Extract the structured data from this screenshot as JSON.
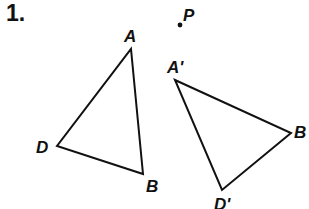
{
  "problem": {
    "number": "1."
  },
  "point": {
    "label": "P",
    "x": 180,
    "y": 25
  },
  "triangles": [
    {
      "name": "original",
      "vertices": [
        {
          "label": "A",
          "x": 131,
          "y": 49
        },
        {
          "label": "B",
          "x": 143,
          "y": 174
        },
        {
          "label": "D",
          "x": 57,
          "y": 146
        }
      ]
    },
    {
      "name": "image",
      "vertices": [
        {
          "label": "A'",
          "x": 175,
          "y": 80
        },
        {
          "label": "B'",
          "x": 291,
          "y": 133
        },
        {
          "label": "D'",
          "x": 222,
          "y": 190
        }
      ]
    }
  ],
  "labels": {
    "A": "A",
    "B": "B",
    "D": "D",
    "A_prime": "A'",
    "B_prime": "B",
    "D_prime": "D'",
    "P": "P"
  },
  "colors": {
    "stroke": "#111111",
    "background": "#ffffff"
  }
}
